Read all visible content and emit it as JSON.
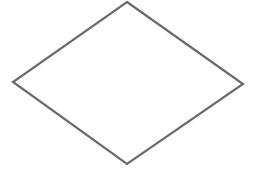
{
  "diagram": {
    "shapes": [
      {
        "type": "diamond",
        "label": "",
        "points": {
          "top": [
            127,
            2
          ],
          "right": [
            243,
            84
          ],
          "bottom": [
            127,
            164
          ],
          "left": [
            13,
            82
          ]
        },
        "stroke": "#6b6b6b",
        "stroke_width": 2.2,
        "fill": "#ffffff"
      }
    ],
    "background": "#ffffff"
  }
}
